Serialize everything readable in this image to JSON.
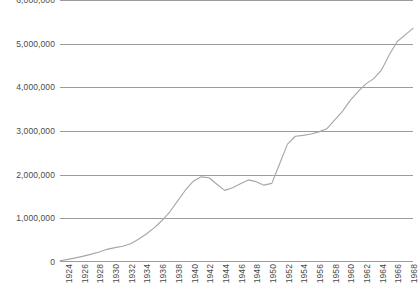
{
  "chart_data": {
    "type": "line",
    "title": "",
    "subtitle": "",
    "xlabel": "",
    "ylabel": "",
    "grid": true,
    "legend": false,
    "legend_position": "none",
    "line_color": "#a6a6a6",
    "grid_color": "#9b9b9b",
    "text_color": "#4a4a4a",
    "background_color": "#ffffff",
    "xlim": [
      1924,
      1969
    ],
    "ylim": [
      0,
      6000000
    ],
    "y_ticks": [
      0,
      1000000,
      2000000,
      3000000,
      4000000,
      5000000,
      6000000
    ],
    "y_tick_labels": [
      "0",
      "1,000,000",
      "2,000,000",
      "3,000,000",
      "4,000,000",
      "5,000,000",
      "6,000,000"
    ],
    "x_tick_labels": [
      "1924",
      "1926",
      "1928",
      "1930",
      "1932",
      "1934",
      "1936",
      "1938",
      "1940",
      "1942",
      "1944",
      "1946",
      "1948",
      "1950",
      "1952",
      "1954",
      "1956",
      "1958",
      "1960",
      "1962",
      "1964",
      "1966",
      "1968"
    ],
    "x": [
      1924,
      1925,
      1926,
      1927,
      1928,
      1929,
      1930,
      1931,
      1932,
      1933,
      1934,
      1935,
      1936,
      1937,
      1938,
      1939,
      1940,
      1941,
      1942,
      1943,
      1944,
      1945,
      1946,
      1947,
      1948,
      1949,
      1950,
      1951,
      1952,
      1953,
      1954,
      1955,
      1956,
      1957,
      1958,
      1959,
      1960,
      1961,
      1962,
      1963,
      1964,
      1965,
      1966,
      1967,
      1968,
      1969
    ],
    "values": [
      30000,
      60000,
      95000,
      135000,
      180000,
      230000,
      290000,
      330000,
      360000,
      420000,
      520000,
      640000,
      780000,
      950000,
      1150000,
      1400000,
      1650000,
      1850000,
      1950000,
      1930000,
      1780000,
      1640000,
      1700000,
      1790000,
      1880000,
      1840000,
      1760000,
      1800000,
      2250000,
      2700000,
      2880000,
      2900000,
      2930000,
      2980000,
      3050000,
      3250000,
      3450000,
      3700000,
      3900000,
      4080000,
      4200000,
      4400000,
      4750000,
      5050000,
      5200000,
      5350000
    ]
  }
}
